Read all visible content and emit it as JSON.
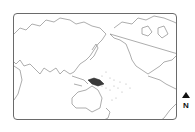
{
  "map": {
    "projection": "pacific-centered world",
    "highlighted_region": "Papua New Guinea",
    "colors": {
      "outline": "#8a8a8a",
      "highlight": "#3a3a3a",
      "frame": "#6a6a6a",
      "islands": "#b0b0b0"
    }
  },
  "north_arrow": {
    "label": "N"
  }
}
